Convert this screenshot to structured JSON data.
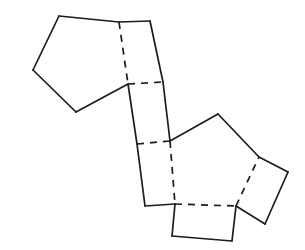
{
  "figure": {
    "background_color": "#ffffff",
    "stroke_color": "#1b1b22",
    "stroke_width": 1.7,
    "dash_pattern": "7 6",
    "width": 305,
    "height": 250
  },
  "geometry": {
    "points": {
      "p_tl_top": [
        59,
        16
      ],
      "p_tl_topright": [
        119,
        22
      ],
      "p_tl_right": [
        128,
        84
      ],
      "p_tl_bottom": [
        76,
        112
      ],
      "p_tl_left": [
        33,
        70
      ],
      "r_top_tr": [
        150,
        21
      ],
      "r_top_br": [
        163,
        82
      ],
      "r_mid_bl": [
        137,
        144
      ],
      "r_mid_br": [
        170,
        141
      ],
      "r_low_bl": [
        145,
        206
      ],
      "p_br_topleft": [
        170,
        141
      ],
      "p_br_top": [
        218,
        114
      ],
      "p_br_right": [
        259,
        157
      ],
      "p_br_bottomright": [
        236,
        206
      ],
      "p_br_bottomleft": [
        175,
        204
      ],
      "sq_b_tl": [
        175,
        204
      ],
      "sq_b_bl": [
        172,
        236
      ],
      "sq_b_br": [
        232,
        241
      ],
      "sq_b_tr": [
        236,
        206
      ],
      "sq_r_tl": [
        259,
        157
      ],
      "sq_r_tr": [
        288,
        172
      ],
      "sq_r_br": [
        265,
        224
      ],
      "sq_r_bl": [
        236,
        206
      ]
    },
    "faces": [
      {
        "name": "pentagon-upper-left",
        "shape": "pentagon",
        "polygon": [
          [
            59,
            16
          ],
          [
            119,
            22
          ],
          [
            128,
            84
          ],
          [
            76,
            112
          ],
          [
            33,
            70
          ]
        ]
      },
      {
        "name": "rectangle-band-upper",
        "shape": "quadrilateral",
        "polygon": [
          [
            119,
            22
          ],
          [
            150,
            21
          ],
          [
            163,
            82
          ],
          [
            128,
            84
          ]
        ]
      },
      {
        "name": "rectangle-band-middle",
        "shape": "quadrilateral",
        "polygon": [
          [
            128,
            84
          ],
          [
            163,
            82
          ],
          [
            170,
            141
          ],
          [
            137,
            144
          ]
        ]
      },
      {
        "name": "rectangle-band-lower",
        "shape": "quadrilateral",
        "polygon": [
          [
            137,
            144
          ],
          [
            170,
            141
          ],
          [
            175,
            204
          ],
          [
            145,
            206
          ]
        ]
      },
      {
        "name": "pentagon-lower-right",
        "shape": "pentagon",
        "polygon": [
          [
            170,
            141
          ],
          [
            218,
            114
          ],
          [
            259,
            157
          ],
          [
            236,
            206
          ],
          [
            175,
            204
          ]
        ]
      },
      {
        "name": "square-bottom",
        "shape": "quadrilateral",
        "polygon": [
          [
            175,
            204
          ],
          [
            236,
            206
          ],
          [
            232,
            241
          ],
          [
            172,
            236
          ]
        ]
      },
      {
        "name": "square-right",
        "shape": "quadrilateral",
        "polygon": [
          [
            259,
            157
          ],
          [
            288,
            172
          ],
          [
            265,
            224
          ],
          [
            236,
            206
          ]
        ]
      }
    ],
    "solid_edges": [
      {
        "name": "pent-ul-top-edge",
        "from": [
          59,
          16
        ],
        "to": [
          119,
          22
        ]
      },
      {
        "name": "pent-ul-left-upper-edge",
        "from": [
          59,
          16
        ],
        "to": [
          33,
          70
        ]
      },
      {
        "name": "pent-ul-left-lower-edge",
        "from": [
          33,
          70
        ],
        "to": [
          76,
          112
        ]
      },
      {
        "name": "pent-ul-bottom-edge",
        "from": [
          76,
          112
        ],
        "to": [
          128,
          84
        ]
      },
      {
        "name": "band-upper-top-edge",
        "from": [
          119,
          22
        ],
        "to": [
          150,
          21
        ]
      },
      {
        "name": "band-upper-right-edge",
        "from": [
          150,
          21
        ],
        "to": [
          163,
          82
        ]
      },
      {
        "name": "band-middle-right-edge",
        "from": [
          163,
          82
        ],
        "to": [
          170,
          141
        ]
      },
      {
        "name": "band-left-upper-edge",
        "from": [
          128,
          84
        ],
        "to": [
          137,
          144
        ]
      },
      {
        "name": "band-left-lower-edge",
        "from": [
          137,
          144
        ],
        "to": [
          145,
          206
        ]
      },
      {
        "name": "band-bottom-edge",
        "from": [
          145,
          206
        ],
        "to": [
          175,
          204
        ]
      },
      {
        "name": "pent-lr-upper-left-edge",
        "from": [
          170,
          141
        ],
        "to": [
          218,
          114
        ]
      },
      {
        "name": "pent-lr-upper-right-edge",
        "from": [
          218,
          114
        ],
        "to": [
          259,
          157
        ]
      },
      {
        "name": "sq-bottom-left-edge",
        "from": [
          175,
          204
        ],
        "to": [
          172,
          236
        ]
      },
      {
        "name": "sq-bottom-bottom-edge",
        "from": [
          172,
          236
        ],
        "to": [
          232,
          241
        ]
      },
      {
        "name": "sq-bottom-right-edge",
        "from": [
          232,
          241
        ],
        "to": [
          236,
          206
        ]
      },
      {
        "name": "sq-right-top-edge",
        "from": [
          259,
          157
        ],
        "to": [
          288,
          172
        ]
      },
      {
        "name": "sq-right-right-edge",
        "from": [
          288,
          172
        ],
        "to": [
          265,
          224
        ]
      },
      {
        "name": "sq-right-bottom-edge",
        "from": [
          265,
          224
        ],
        "to": [
          236,
          206
        ]
      }
    ],
    "dashed_edges": [
      {
        "name": "fold-pent-ul-right-edge",
        "from": [
          119,
          22
        ],
        "to": [
          128,
          84
        ]
      },
      {
        "name": "fold-band-upper-bottom-edge",
        "from": [
          128,
          84
        ],
        "to": [
          163,
          82
        ]
      },
      {
        "name": "fold-band-middle-bottom-edge",
        "from": [
          137,
          144
        ],
        "to": [
          170,
          141
        ]
      },
      {
        "name": "fold-pent-lr-left-edge",
        "from": [
          170,
          141
        ],
        "to": [
          175,
          204
        ]
      },
      {
        "name": "fold-pent-lr-bottom-edge",
        "from": [
          175,
          204
        ],
        "to": [
          236,
          206
        ]
      },
      {
        "name": "fold-pent-lr-right-edge",
        "from": [
          236,
          206
        ],
        "to": [
          259,
          157
        ]
      }
    ]
  }
}
